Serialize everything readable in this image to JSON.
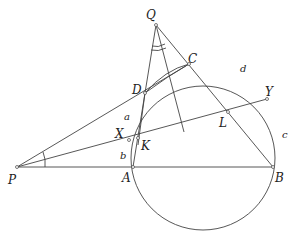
{
  "diagram": {
    "type": "geometry",
    "points": {
      "P": {
        "label": "P",
        "x": 17,
        "y": 167
      },
      "A": {
        "label": "A",
        "x": 133,
        "y": 167
      },
      "B": {
        "label": "B",
        "x": 273,
        "y": 167
      },
      "Q": {
        "label": "Q",
        "x": 156,
        "y": 25
      },
      "C": {
        "label": "C",
        "x": 189,
        "y": 64
      },
      "D": {
        "label": "D",
        "x": 145,
        "y": 93
      },
      "X": {
        "label": "X",
        "x": 129,
        "y": 140
      },
      "K": {
        "label": "K",
        "x": 138,
        "y": 138
      },
      "Y": {
        "label": "Y",
        "x": 267,
        "y": 99
      },
      "L": {
        "label": "L",
        "x": 228,
        "y": 112
      }
    },
    "arc_labels": {
      "a": "a",
      "b": "b",
      "c": "c",
      "d": "d"
    },
    "circle": {
      "cx": 203,
      "cy": 158,
      "r": 72
    }
  }
}
